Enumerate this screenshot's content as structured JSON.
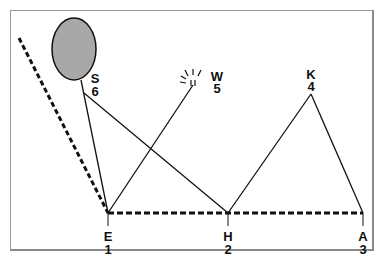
{
  "diagram": {
    "nodes": [
      {
        "id": "E",
        "letter": "E",
        "number": "1"
      },
      {
        "id": "H",
        "letter": "H",
        "number": "2"
      },
      {
        "id": "A",
        "letter": "A",
        "number": "3"
      },
      {
        "id": "K",
        "letter": "K",
        "number": "4"
      },
      {
        "id": "W",
        "letter": "W",
        "number": "5"
      },
      {
        "id": "S",
        "letter": "S",
        "number": "6"
      }
    ],
    "edges": [
      {
        "from": "S",
        "to": "E",
        "style": "solid"
      },
      {
        "from": "S",
        "to": "H",
        "style": "solid"
      },
      {
        "from": "E",
        "to": "W",
        "style": "solid"
      },
      {
        "from": "H",
        "to": "K",
        "style": "solid"
      },
      {
        "from": "K",
        "to": "A",
        "style": "solid"
      },
      {
        "from": "E",
        "to": "A",
        "style": "dashed"
      },
      {
        "from": "E",
        "to": "upper-left",
        "style": "dashed"
      }
    ],
    "shapes": {
      "S": "gray-ellipse",
      "W": "light-burst"
    },
    "colors": {
      "ellipse_fill": "#a8a8a8",
      "line": "#111111",
      "frame": "#9a9a9a"
    }
  }
}
